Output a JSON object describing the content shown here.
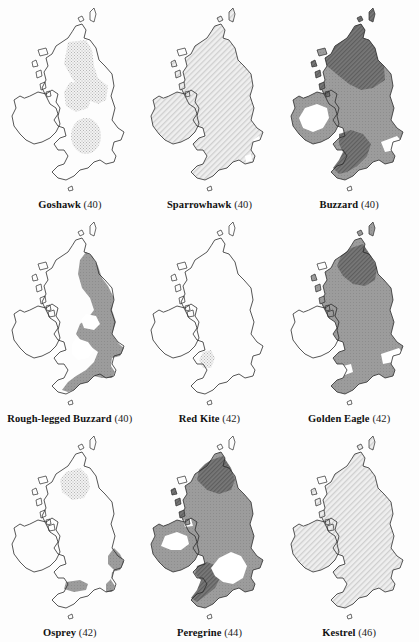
{
  "figure": {
    "type": "map-grid",
    "rows": 3,
    "columns": 3,
    "background_color": "#fdfdfd",
    "outline_color": "#2b2b2b",
    "region": "British Isles (Britain and Ireland)"
  },
  "legend_shades": {
    "white": "#ffffff",
    "light_stipple": "#e3e3e3",
    "mid_gray": "#9c9c9c",
    "dark_hatch": "#6f6f6f"
  },
  "panels": [
    {
      "id": "goshawk",
      "species": "Goshawk",
      "number": "(40)",
      "caption": "Goshawk (40)",
      "fills": [
        {
          "region": "central-scotland",
          "shade": "light_stipple"
        },
        {
          "region": "northern-england",
          "shade": "light_stipple"
        },
        {
          "region": "english-midlands",
          "shade": "light_stipple"
        }
      ],
      "ireland_shade": "white",
      "britain_base_shade": "white"
    },
    {
      "id": "sparrowhawk",
      "species": "Sparrowhawk",
      "number": "(40)",
      "caption": "Sparrowhawk (40)",
      "fills": [
        {
          "region": "all-britain",
          "shade": "light_stipple"
        },
        {
          "region": "all-ireland",
          "shade": "light_stipple"
        }
      ],
      "ireland_shade": "light_stipple",
      "britain_base_shade": "light_stipple"
    },
    {
      "id": "buzzard",
      "species": "Buzzard",
      "number": "(40)",
      "caption": "Buzzard (40)",
      "fills": [
        {
          "region": "scotland",
          "shade": "dark_hatch"
        },
        {
          "region": "northern-england",
          "shade": "mid_gray"
        },
        {
          "region": "wales-southwest",
          "shade": "dark_hatch"
        },
        {
          "region": "ireland-coastal-ring",
          "shade": "mid_gray"
        },
        {
          "region": "east-anglia",
          "shade": "white"
        }
      ],
      "ireland_shade": "mid_gray",
      "britain_base_shade": "mid_gray"
    },
    {
      "id": "rough-legged-buzzard",
      "species": "Rough-legged Buzzard",
      "number": "(40)",
      "caption": "Rough-legged Buzzard (40)",
      "fills": [
        {
          "region": "eastern-britain",
          "shade": "mid_gray"
        },
        {
          "region": "eastern-scotland",
          "shade": "mid_gray"
        },
        {
          "region": "southern-england",
          "shade": "mid_gray"
        }
      ],
      "ireland_shade": "white",
      "britain_base_shade": "white"
    },
    {
      "id": "red-kite",
      "species": "Red Kite",
      "number": "(42)",
      "caption": "Red Kite (42)",
      "fills": [
        {
          "region": "mid-wales",
          "shade": "light_stipple"
        }
      ],
      "ireland_shade": "white",
      "britain_base_shade": "white"
    },
    {
      "id": "golden-eagle",
      "species": "Golden Eagle",
      "number": "(42)",
      "caption": "Golden Eagle (42)",
      "fills": [
        {
          "region": "all-britain",
          "shade": "mid_gray"
        },
        {
          "region": "scottish-highlands",
          "shade": "dark_hatch"
        },
        {
          "region": "the-wash",
          "shade": "white"
        }
      ],
      "ireland_shade": "white",
      "britain_base_shade": "mid_gray"
    },
    {
      "id": "osprey",
      "species": "Osprey",
      "number": "(42)",
      "caption": "Osprey (42)",
      "fills": [
        {
          "region": "scottish-highlands",
          "shade": "light_stipple"
        },
        {
          "region": "east-coast-england",
          "shade": "mid_gray"
        },
        {
          "region": "south-coast-england",
          "shade": "mid_gray"
        }
      ],
      "ireland_shade": "white",
      "britain_base_shade": "white"
    },
    {
      "id": "peregrine",
      "species": "Peregrine",
      "number": "(44)",
      "caption": "Peregrine (44)",
      "fills": [
        {
          "region": "all-britain",
          "shade": "mid_gray"
        },
        {
          "region": "scottish-highlands",
          "shade": "dark_hatch"
        },
        {
          "region": "wales",
          "shade": "dark_hatch"
        },
        {
          "region": "ireland-coastal-ring",
          "shade": "mid_gray"
        },
        {
          "region": "central-england",
          "shade": "white"
        }
      ],
      "ireland_shade": "mid_gray",
      "britain_base_shade": "mid_gray"
    },
    {
      "id": "kestrel",
      "species": "Kestrel",
      "number": "(46)",
      "caption": "Kestrel (46)",
      "fills": [
        {
          "region": "all-britain",
          "shade": "light_stipple"
        },
        {
          "region": "all-ireland",
          "shade": "light_stipple"
        }
      ],
      "ireland_shade": "light_stipple",
      "britain_base_shade": "light_stipple"
    }
  ]
}
